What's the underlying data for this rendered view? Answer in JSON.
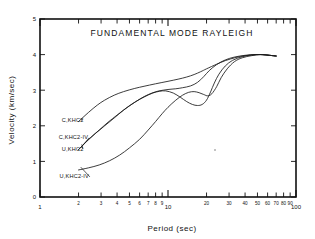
{
  "chart_data": {
    "type": "line",
    "title": "FUNDAMENTAL  MODE  RAYLEIGH",
    "xlabel": "Period  (sec)",
    "ylabel": "Velocity  (km/sec)",
    "xscale": "log",
    "yscale": "linear",
    "xlim": [
      1,
      100
    ],
    "ylim": [
      0,
      5
    ],
    "grid": false,
    "legend_position": "inline-left",
    "xticks": [
      1,
      2,
      3,
      4,
      5,
      6,
      7,
      8,
      9,
      10,
      20,
      30,
      40,
      50,
      60,
      70,
      80,
      90,
      100
    ],
    "xticklabels": [
      "1",
      "2",
      "3",
      "4",
      "5",
      "6",
      "7",
      "8",
      "9",
      "10",
      "20",
      "30",
      "40",
      "50",
      "60",
      "70",
      "80",
      "90",
      "100"
    ],
    "xmajor": [
      1,
      10,
      100
    ],
    "yticks": [
      0,
      1,
      2,
      3,
      4,
      5
    ],
    "yticklabels": [
      "0",
      "1",
      "2",
      "3",
      "4",
      "5"
    ],
    "series": [
      {
        "name": "C,KHC2",
        "label": "C,KHC2",
        "color": "#1a1a1a",
        "points": [
          [
            2.0,
            2.12
          ],
          [
            2.4,
            2.38
          ],
          [
            2.8,
            2.58
          ],
          [
            3.2,
            2.72
          ],
          [
            3.8,
            2.86
          ],
          [
            4.5,
            2.96
          ],
          [
            5.5,
            3.05
          ],
          [
            6.5,
            3.11
          ],
          [
            8.0,
            3.18
          ],
          [
            10.0,
            3.25
          ],
          [
            12.0,
            3.31
          ],
          [
            14.0,
            3.37
          ],
          [
            16.0,
            3.44
          ],
          [
            18.0,
            3.52
          ],
          [
            20.0,
            3.6
          ],
          [
            24.0,
            3.73
          ],
          [
            28.0,
            3.83
          ],
          [
            34.0,
            3.92
          ],
          [
            40.0,
            3.97
          ],
          [
            48.0,
            4.0
          ],
          [
            55.0,
            4.0
          ],
          [
            62.0,
            3.98
          ],
          [
            70.0,
            3.96
          ]
        ]
      },
      {
        "name": "C,KHC2-IV",
        "label": "C,KHC2-IV",
        "color": "#1a1a1a",
        "points": [
          [
            2.0,
            1.33
          ],
          [
            2.3,
            1.55
          ],
          [
            2.7,
            1.78
          ],
          [
            3.2,
            2.0
          ],
          [
            3.8,
            2.22
          ],
          [
            4.5,
            2.44
          ],
          [
            5.5,
            2.66
          ],
          [
            6.5,
            2.82
          ],
          [
            7.5,
            2.92
          ],
          [
            8.5,
            2.98
          ],
          [
            10.0,
            3.02
          ],
          [
            11.5,
            3.04
          ],
          [
            13.0,
            3.07
          ],
          [
            15.0,
            3.12
          ],
          [
            17.0,
            3.22
          ],
          [
            19.0,
            3.38
          ],
          [
            21.0,
            3.55
          ],
          [
            24.0,
            3.72
          ],
          [
            28.0,
            3.85
          ],
          [
            33.0,
            3.93
          ],
          [
            40.0,
            3.98
          ],
          [
            48.0,
            4.0
          ],
          [
            55.0,
            4.0
          ],
          [
            62.0,
            3.98
          ],
          [
            70.0,
            3.96
          ]
        ]
      },
      {
        "name": "U,KHC2",
        "label": "U,KHC2",
        "color": "#1a1a1a",
        "points": [
          [
            2.0,
            1.33
          ],
          [
            2.4,
            1.62
          ],
          [
            2.9,
            1.88
          ],
          [
            3.4,
            2.1
          ],
          [
            4.0,
            2.3
          ],
          [
            4.8,
            2.52
          ],
          [
            5.6,
            2.68
          ],
          [
            6.6,
            2.82
          ],
          [
            7.6,
            2.92
          ],
          [
            8.6,
            2.97
          ],
          [
            9.6,
            2.98
          ],
          [
            11.0,
            2.92
          ],
          [
            12.5,
            2.8
          ],
          [
            14.0,
            2.68
          ],
          [
            15.5,
            2.6
          ],
          [
            17.0,
            2.57
          ],
          [
            18.5,
            2.6
          ],
          [
            20.0,
            2.72
          ],
          [
            21.5,
            2.95
          ],
          [
            23.0,
            3.2
          ],
          [
            25.0,
            3.45
          ],
          [
            28.0,
            3.68
          ],
          [
            32.0,
            3.84
          ],
          [
            38.0,
            3.94
          ],
          [
            45.0,
            3.99
          ],
          [
            53.0,
            4.0
          ],
          [
            62.0,
            3.98
          ],
          [
            70.0,
            3.96
          ]
        ]
      },
      {
        "name": "U,KHC2-IV",
        "label": "U,KHC2-IV",
        "color": "#1a1a1a",
        "points": [
          [
            2.0,
            0.76
          ],
          [
            2.4,
            0.82
          ],
          [
            2.9,
            0.9
          ],
          [
            3.5,
            1.02
          ],
          [
            4.2,
            1.18
          ],
          [
            5.0,
            1.38
          ],
          [
            6.0,
            1.62
          ],
          [
            7.0,
            1.88
          ],
          [
            8.0,
            2.12
          ],
          [
            9.0,
            2.34
          ],
          [
            10.0,
            2.52
          ],
          [
            11.5,
            2.72
          ],
          [
            13.0,
            2.86
          ],
          [
            14.5,
            2.94
          ],
          [
            16.0,
            2.96
          ],
          [
            17.5,
            2.93
          ],
          [
            19.0,
            2.88
          ],
          [
            20.5,
            2.84
          ],
          [
            22.0,
            2.9
          ],
          [
            24.0,
            3.1
          ],
          [
            26.0,
            3.35
          ],
          [
            29.0,
            3.6
          ],
          [
            33.0,
            3.8
          ],
          [
            38.0,
            3.91
          ],
          [
            45.0,
            3.97
          ],
          [
            53.0,
            4.0
          ],
          [
            62.0,
            3.98
          ],
          [
            70.0,
            3.96
          ]
        ]
      }
    ],
    "annotations": [
      {
        "label": "C,KHC2",
        "text_x": 1.48,
        "text_y": 2.12,
        "tip_x": 2.08,
        "tip_y": 2.18
      },
      {
        "label": "C,KHC2-IV",
        "text_x": 1.4,
        "text_y": 1.62,
        "tip_x": 2.1,
        "tip_y": 1.4
      },
      {
        "label": "U,KHC2",
        "text_x": 1.48,
        "text_y": 1.3,
        "tip_x": 2.12,
        "tip_y": 1.48
      },
      {
        "label": "U,KHC2-IV",
        "text_x": 1.42,
        "text_y": 0.52,
        "tip_x": 2.08,
        "tip_y": 0.84
      }
    ]
  }
}
